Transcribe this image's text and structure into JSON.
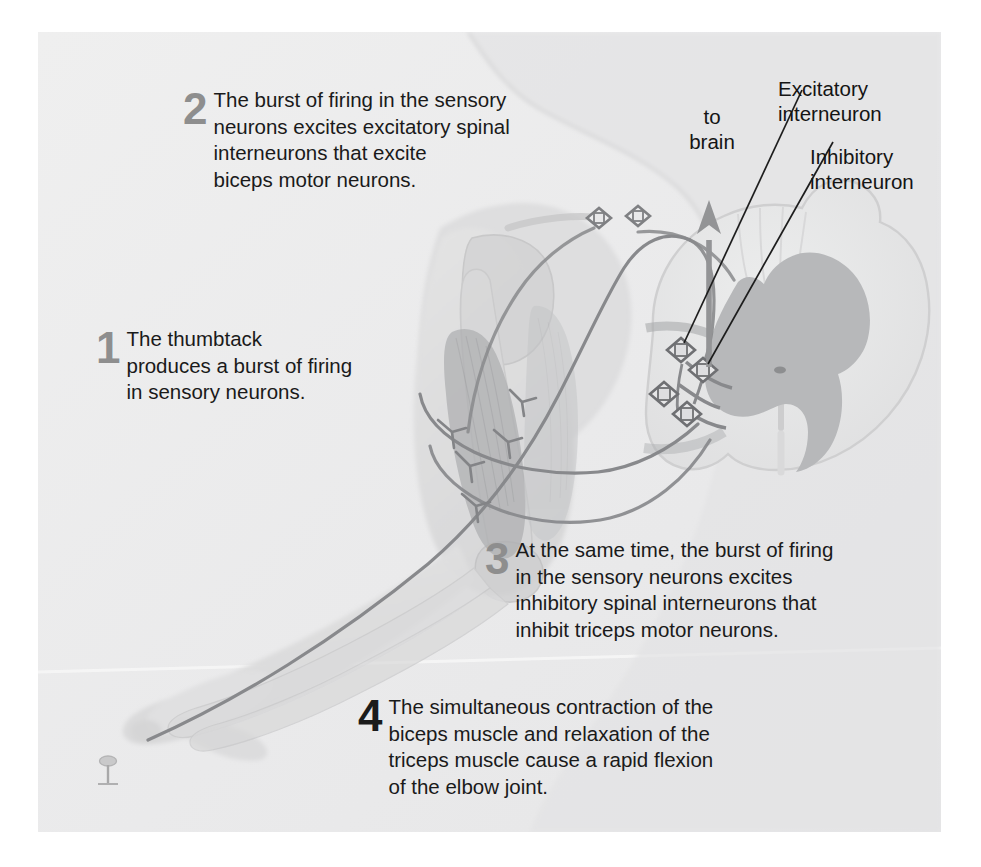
{
  "figure": {
    "title_semantic": "stretch-reflex-pathway-diagram",
    "background_color": "#ececed",
    "callouts": [
      {
        "id": "callout-1",
        "number": "1",
        "number_color": "#8e8e8e",
        "text": "The thumbtack\nproduces a burst of firing\nin sensory neurons."
      },
      {
        "id": "callout-2",
        "number": "2",
        "number_color": "#8e8e8e",
        "text": "The burst of firing in the sensory\nneurons excites excitatory spinal\ninterneurons that excite\nbiceps motor neurons."
      },
      {
        "id": "callout-3",
        "number": "3",
        "number_color": "#8e8e8e",
        "text": "At the same time, the burst of firing\nin the sensory neurons excites\ninhibitory spinal interneurons that\ninhibit triceps motor neurons."
      },
      {
        "id": "callout-4",
        "number": "4",
        "number_color": "#1b1b1b",
        "text": "The simultaneous contraction of the\nbiceps muscle and relaxation of the\ntriceps muscle cause a rapid flexion\nof the elbow joint."
      }
    ],
    "labels": [
      {
        "id": "label-to-brain",
        "text": "to\nbrain"
      },
      {
        "id": "label-excitatory-interneuron",
        "text": "Excitatory\ninterneuron"
      },
      {
        "id": "label-inhibitory-interneuron",
        "text": "Inhibitory\ninterneuron"
      }
    ],
    "anatomy": {
      "body_silhouette": "torso-and-arm",
      "spinal_cord": "cross-section",
      "gray_matter_color": "#b9b9ba",
      "white_matter_color": "#e2e2e3",
      "nerve_color": "#8f9092",
      "muscle_color": "#b4b5b7",
      "bone_color": "#d3d3d4",
      "skin_color": "#dedede",
      "thumbtack": "thumbtack-under-fingertip",
      "synapse_count": 4
    }
  }
}
